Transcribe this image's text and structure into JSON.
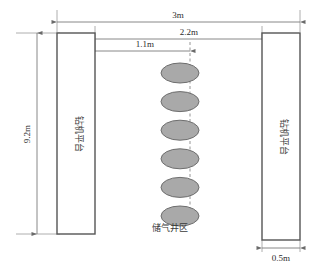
{
  "diagram": {
    "platform_left_label": "钻机平台",
    "platform_right_label": "钻机平台",
    "well_area_label": "储气井区",
    "dimensions": {
      "overall_width": "3m",
      "platform_to_center": "2.2m",
      "platform_to_well_edge": "1.1m",
      "platform_height": "9.2m",
      "platform_thickness": "0.5m"
    },
    "well_count": 6,
    "colors": {
      "well_fill": "#a9a9a9",
      "well_stroke": "#6e6e6e",
      "rect_stroke": "#555555",
      "dim_line": "#7a7a7a",
      "background": "#ffffff"
    }
  },
  "chart_data": {
    "type": "diagram",
    "units": "m",
    "elements": [
      {
        "name": "left-platform",
        "label": "钻机平台",
        "width": 0.5,
        "height": 9.2
      },
      {
        "name": "right-platform",
        "label": "钻机平台",
        "width": 0.5,
        "height": 9.2
      },
      {
        "name": "well-area",
        "label": "储气井区",
        "count": 6
      }
    ],
    "annotations": [
      {
        "label": "3m",
        "value": 3.0,
        "span": "outer-edge-to-outer-edge"
      },
      {
        "label": "2.2m",
        "value": 2.2,
        "span": "left-platform-inner-to-right-platform-inner"
      },
      {
        "label": "1.1m",
        "value": 1.1,
        "span": "left-platform-inner-to-well-centerline"
      },
      {
        "label": "9.2m",
        "value": 9.2,
        "span": "platform-vertical-height"
      },
      {
        "label": "0.5m",
        "value": 0.5,
        "span": "platform-thickness"
      }
    ]
  }
}
